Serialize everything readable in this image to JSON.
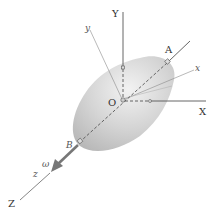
{
  "diagram": {
    "labels": {
      "Y": "Y",
      "y": "y",
      "A": "A",
      "x": "x",
      "O": "O",
      "X": "X",
      "B": "B",
      "omega": "ω",
      "z": "z",
      "Z": "Z"
    },
    "colors": {
      "body_fill": "#c8c8c8",
      "body_highlight": "#ececec",
      "axis_line": "#555555",
      "thin_axis": "#8a8a8a",
      "omega_arrow": "#777777",
      "background": "#ffffff"
    }
  }
}
